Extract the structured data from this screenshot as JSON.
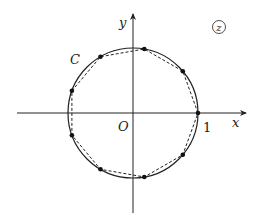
{
  "diagram": {
    "title": "",
    "plane_label": "z",
    "curve_label": "C",
    "origin_label": "O",
    "unit_label": "1",
    "x_axis_label": "x",
    "y_axis_label": "y",
    "geometry": {
      "origin_px": [
        133,
        113
      ],
      "radius_px": 65,
      "x_axis_px": [
        17,
        247
      ],
      "y_axis_px": [
        213,
        13
      ]
    },
    "circle": {
      "center": [
        0,
        0
      ],
      "radius": 1,
      "style": "solid"
    },
    "polygon": {
      "vertices_count": 9,
      "style": "dashed",
      "description": "regular 9-gon inscribed in unit circle"
    },
    "points_angles_deg": [
      0,
      40,
      80,
      120,
      160,
      200,
      240,
      280,
      320
    ],
    "colors": {
      "stroke": "#222222",
      "background": "#ffffff"
    }
  }
}
